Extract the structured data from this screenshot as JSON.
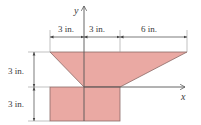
{
  "figure": {
    "type": "composite-area-diagram",
    "fill_color": "#eaa9a3",
    "edge_color": "#8a6a66",
    "line_color": "#555555",
    "axes": {
      "x_label": "x",
      "y_label": "y"
    },
    "dimensions": {
      "top_left": "3 in.",
      "top_middle": "3 in.",
      "top_right": "6 in.",
      "left_upper": "3 in.",
      "left_lower": "3 in."
    },
    "shapes": [
      {
        "name": "trapezoid",
        "description": "upper shape, top width 12 in., bottom width 3 in., height 3 in."
      },
      {
        "name": "rectangle",
        "description": "lower shape, 6 in. wide by 3 in. tall"
      }
    ]
  }
}
